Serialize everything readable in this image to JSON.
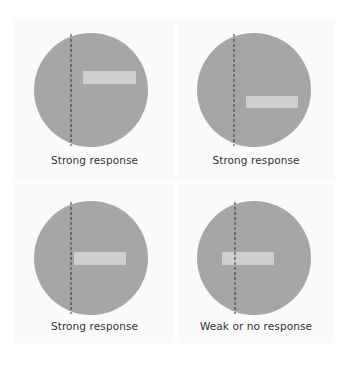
{
  "colors": {
    "background": "#ffffff",
    "panel_background": "#fafafa",
    "receptive_field": "#a6a6a6",
    "bar_stimulus": "#cfcfcf",
    "boundary_line": "#333333",
    "label_text": "#333333"
  },
  "panels": [
    {
      "position": "top-left",
      "label": "Strong response",
      "circle": {
        "cx": 77,
        "cy": 71,
        "r": 57
      },
      "dashed_line_x": 57,
      "bar": {
        "x": 69,
        "y": 52,
        "width": 53,
        "height": 13
      }
    },
    {
      "position": "top-right",
      "label": "Strong response",
      "circle": {
        "cx": 77,
        "cy": 71,
        "r": 57
      },
      "dashed_line_x": 57,
      "bar": {
        "x": 69,
        "y": 77,
        "width": 52,
        "height": 12
      }
    },
    {
      "position": "bottom-left",
      "label": "Strong response",
      "circle": {
        "cx": 77,
        "cy": 74,
        "r": 57
      },
      "dashed_line_x": 57,
      "bar": {
        "x": 60,
        "y": 68,
        "width": 52,
        "height": 13
      }
    },
    {
      "position": "bottom-right",
      "label": "Weak or no response",
      "circle": {
        "cx": 77,
        "cy": 74,
        "r": 57
      },
      "dashed_line_x": 58,
      "bar": {
        "x": 45,
        "y": 68,
        "width": 52,
        "height": 13
      }
    }
  ]
}
